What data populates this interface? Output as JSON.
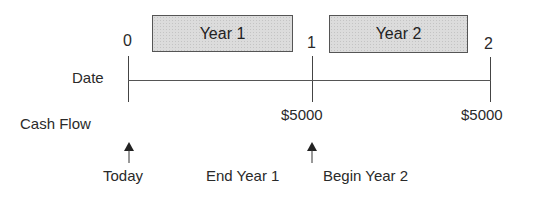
{
  "periods": [
    {
      "label": "Year 1"
    },
    {
      "label": "Year 2"
    }
  ],
  "ticks": [
    {
      "label": "0"
    },
    {
      "label": "1"
    },
    {
      "label": "2"
    }
  ],
  "rows": {
    "date_label": "Date",
    "cash_flow_label": "Cash Flow"
  },
  "cash_flows": [
    {
      "at": "1",
      "value": "$5000"
    },
    {
      "at": "2",
      "value": "$5000"
    }
  ],
  "annotations": [
    {
      "label": "Today"
    },
    {
      "label": "End Year 1"
    },
    {
      "label": "Begin Year 2"
    }
  ]
}
